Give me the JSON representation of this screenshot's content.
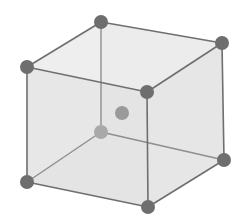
{
  "diagram": {
    "type": "body-centered-cubic-unit-cell",
    "colors": {
      "background": "#ffffff",
      "face_top": "#ececec",
      "face_front": "#e3e3e3",
      "face_right": "#e6e6e6",
      "face_back": "#eaeaea",
      "edge_front": "#6f6f6f",
      "edge_hidden": "#8e8e8e",
      "atom_corner": "#6e6e6e",
      "atom_hidden": "#a9a9a9",
      "atom_center": "#9a9a9a"
    },
    "vertices": {
      "top_back_left": [
        101,
        22
      ],
      "top_back_right": [
        222,
        43
      ],
      "top_front_left": [
        27,
        67
      ],
      "top_front_right": [
        147,
        92
      ],
      "bottom_back_left": [
        101,
        132
      ],
      "bottom_back_right": [
        224,
        160
      ],
      "bottom_front_left": [
        27,
        182
      ],
      "bottom_front_right": [
        148,
        207
      ]
    },
    "center_atom": [
      122,
      113
    ],
    "atom_radius": 7,
    "center_atom_radius": 7
  }
}
